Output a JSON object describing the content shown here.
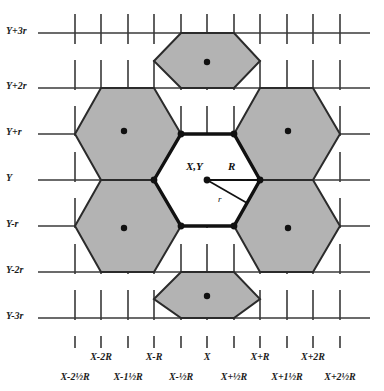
{
  "figure": {
    "type": "diagram",
    "colors": {
      "hex_fill": "#b3b3b3",
      "hex_fill_center": "#ffffff",
      "hex_stroke": "#2b2b2b",
      "hex_stroke_center": "#111111",
      "grid_line": "#3a3a3a",
      "dot": "#111111",
      "background": "#ffffff",
      "text": "#1c1c1c"
    },
    "geometry": {
      "R": 53,
      "r": 46,
      "center_x": 207,
      "center_y": 180,
      "orientation": "flat-top",
      "hex_count": 7
    }
  },
  "y_axis": {
    "name": "y-axis",
    "labels": [
      {
        "text": "Y+3r",
        "y": 33
      },
      {
        "text": "Y+2r",
        "y": 88
      },
      {
        "text": "Y+r",
        "y": 134
      },
      {
        "text": "Y",
        "y": 180
      },
      {
        "text": "Y-r",
        "y": 226
      },
      {
        "text": "Y-2r",
        "y": 272
      },
      {
        "text": "Y-3r",
        "y": 318
      }
    ]
  },
  "x_axis": {
    "name": "x-axis",
    "major_labels": [
      {
        "text": "X-2R",
        "x": 101
      },
      {
        "text": "X-R",
        "x": 154
      },
      {
        "text": "X",
        "x": 207
      },
      {
        "text": "X+R",
        "x": 260
      },
      {
        "text": "X+2R",
        "x": 313
      }
    ],
    "minor_labels": [
      {
        "text": "X-2½R",
        "x": 75
      },
      {
        "text": "X-1½R",
        "x": 128
      },
      {
        "text": "X-½R",
        "x": 181
      },
      {
        "text": "X+½R",
        "x": 234
      },
      {
        "text": "X+1½R",
        "x": 287
      },
      {
        "text": "X+2½R",
        "x": 340
      }
    ]
  },
  "annotations": {
    "center_point": "X,Y",
    "circumradius": "R",
    "inradius": "r"
  },
  "hexagons": [
    {
      "name": "hex-top",
      "cx": 207,
      "cy": 88,
      "filled": true
    },
    {
      "name": "hex-upper-left",
      "cx": 128,
      "cy": 134,
      "filled": true
    },
    {
      "name": "hex-upper-right",
      "cx": 286,
      "cy": 134,
      "filled": true
    },
    {
      "name": "hex-center",
      "cx": 207,
      "cy": 180,
      "filled": false
    },
    {
      "name": "hex-lower-left",
      "cx": 128,
      "cy": 226,
      "filled": true
    },
    {
      "name": "hex-lower-right",
      "cx": 286,
      "cy": 226,
      "filled": true
    },
    {
      "name": "hex-bottom",
      "cx": 207,
      "cy": 272,
      "filled": true
    }
  ]
}
